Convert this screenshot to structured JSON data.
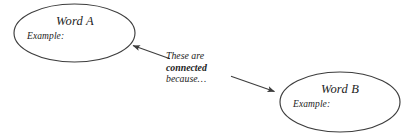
{
  "diagram": {
    "type": "concept-link-diagram",
    "background_color": "#ffffff",
    "stroke_color": "#3d3d3d",
    "text_color": "#1c1c1c",
    "nodes": [
      {
        "id": "word-a",
        "shape": "ellipse",
        "title": "Word A",
        "example_label": "Example:",
        "cx": 74.5,
        "cy": 33,
        "rx": 60.5,
        "ry": 29
      },
      {
        "id": "word-b",
        "shape": "ellipse",
        "title": "Word B",
        "example_label": "Example:",
        "cx": 340,
        "cy": 102,
        "rx": 60,
        "ry": 30
      }
    ],
    "edge_label": {
      "line1": "These are",
      "line2": "connected",
      "line3": "because…",
      "line2_style": "bold-italic"
    },
    "arrows": [
      {
        "id": "arrow-to-word-a",
        "from": [
          170,
          59
        ],
        "to": [
          130,
          45
        ],
        "direction": "left-up",
        "target": "word-a"
      },
      {
        "id": "arrow-to-word-b",
        "from": [
          231,
          76
        ],
        "to": [
          278,
          93
        ],
        "direction": "right-down",
        "target": "word-b"
      }
    ]
  }
}
